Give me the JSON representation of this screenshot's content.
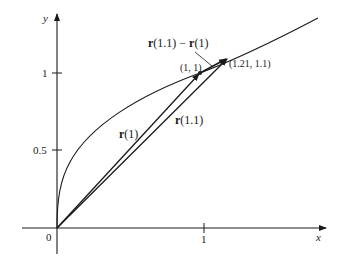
{
  "figure": {
    "axes": {
      "x_label": "x",
      "y_label": "y",
      "origin_label": "0",
      "x_ticks": [
        {
          "value": 1,
          "label": "1"
        }
      ],
      "y_ticks": [
        {
          "value": 0.5,
          "label": "0.5"
        },
        {
          "value": 1,
          "label": "1"
        }
      ]
    },
    "curve": {
      "description": "x = t^2, y = t (i.e. y = sqrt(x))"
    },
    "vectors": [
      {
        "name": "r(1)",
        "bold_part": "r",
        "rest": "(1)",
        "from": [
          0,
          0
        ],
        "to": [
          1,
          1
        ]
      },
      {
        "name": "r(1.1)",
        "bold_part": "r",
        "rest": "(1.1)",
        "from": [
          0,
          0
        ],
        "to": [
          1.21,
          1.1
        ]
      },
      {
        "name": "r(1.1) − r(1)",
        "from": [
          1,
          1
        ],
        "to": [
          1.21,
          1.1
        ]
      }
    ],
    "points": [
      {
        "label": "(1, 1)",
        "x": 1,
        "y": 1
      },
      {
        "label": "(1.21, 1.1)",
        "x": 1.21,
        "y": 1.1
      }
    ],
    "annotations": {
      "difference_label_r1": "r",
      "difference_label_part1": "(1.1) − ",
      "difference_label_r2": "r",
      "difference_label_part2": "(1)"
    },
    "colors": {
      "ink": "#1a1a1a",
      "background": "#ffffff"
    }
  }
}
